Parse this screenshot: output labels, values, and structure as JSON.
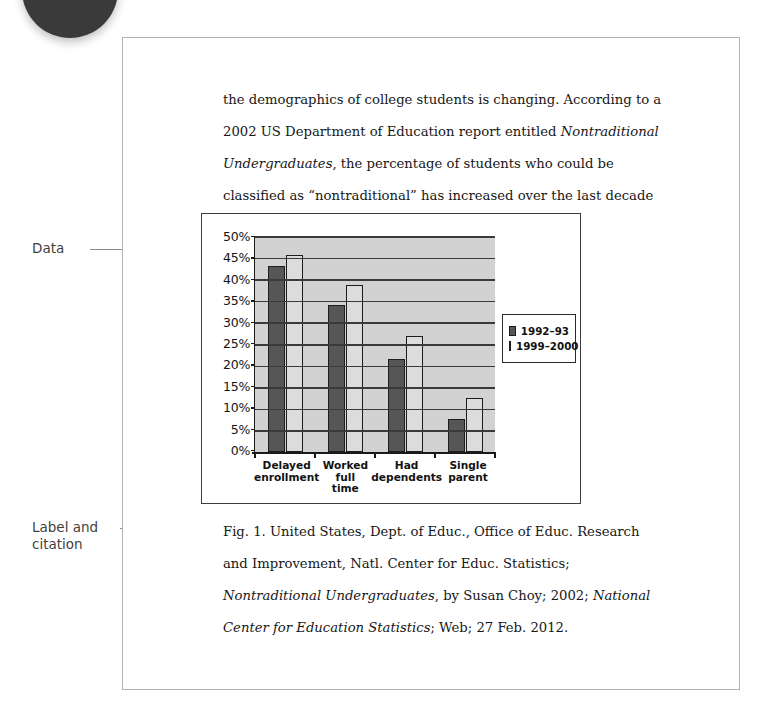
{
  "annotations": {
    "data_label": "Data",
    "label_citation_line1": "Label and",
    "label_citation_line2": "citation"
  },
  "body": {
    "line1": "the demographics of college students is changing. According to a",
    "line2_pre": "2002 US Department of Education report entitled ",
    "line2_italic": "Nontraditional",
    "line3_italic": "Undergraduates",
    "line3_post": ", the percentage of students who could be classified",
    "line4": "as “nontraditional” has increased over the last decade (see fig. 1)."
  },
  "caption": {
    "seg1": "Fig. 1. United States, Dept. of Educ., Office of Educ. Research and Improvement, Natl. Center for Educ. Statistics; ",
    "seg2_italic": "Nontraditional Undergraduates",
    "seg3": ", by Susan Choy; 2002; ",
    "seg4_italic": "National Center for Education Statistics",
    "seg5": "; Web; 27 Feb. 2012."
  },
  "chart_data": {
    "type": "bar",
    "title": "",
    "xlabel": "",
    "ylabel": "",
    "ylim": [
      0,
      50
    ],
    "ytick_values": [
      50,
      45,
      40,
      35,
      30,
      25,
      20,
      15,
      10,
      5,
      0
    ],
    "ytick_labels": [
      "50%",
      "45%",
      "40%",
      "35%",
      "30%",
      "25%",
      "20%",
      "15%",
      "10%",
      "5%",
      "0%"
    ],
    "grid": true,
    "grid_axis": "y",
    "legend_position": "right",
    "categories": [
      "Delayed enrollment",
      "Worked full time",
      "Had dependents",
      "Single parent"
    ],
    "category_lines": [
      [
        "Delayed",
        "enrollment"
      ],
      [
        "Worked",
        "full",
        "time"
      ],
      [
        "Had",
        "dependents"
      ],
      [
        "Single",
        "parent"
      ]
    ],
    "series": [
      {
        "name": "1992–93",
        "color": "#565656",
        "values": [
          43.0,
          34.0,
          21.6,
          7.7
        ]
      },
      {
        "name": "1999–2000",
        "color": "#dcdcdc",
        "values": [
          45.7,
          38.7,
          26.8,
          12.5
        ]
      }
    ],
    "plot_background": "#d2d2d2",
    "axis_color": "#1a1a1a"
  }
}
